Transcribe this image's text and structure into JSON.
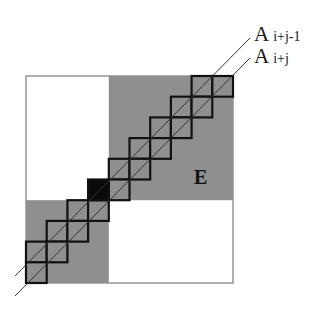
{
  "diagram": {
    "type": "block matrix staircase diagram",
    "grid_size": 10,
    "matrix": {
      "x": 26,
      "y": 76,
      "size": 207
    },
    "colors": {
      "background": "#ffffff",
      "gray_block": "#8f8f8f",
      "cell_border": "#111111",
      "black_cell": "#0a0a0a",
      "outline": "#7a7a7a",
      "diagonal": "#333333"
    },
    "gray_blocks": [
      {
        "name": "upper-right-block",
        "col": 4,
        "row": 0,
        "cols": 6,
        "rows": 6
      },
      {
        "name": "lower-left-block",
        "col": 0,
        "row": 6,
        "cols": 4,
        "rows": 4
      }
    ],
    "black_cell": {
      "col": 3,
      "row": 5
    },
    "staircase_cells": [
      [
        8,
        0
      ],
      [
        9,
        0
      ],
      [
        7,
        1
      ],
      [
        8,
        1
      ],
      [
        6,
        2
      ],
      [
        7,
        2
      ],
      [
        5,
        3
      ],
      [
        6,
        3
      ],
      [
        4,
        4
      ],
      [
        5,
        4
      ],
      [
        4,
        5
      ],
      [
        2,
        6
      ],
      [
        3,
        6
      ],
      [
        1,
        7
      ],
      [
        2,
        7
      ],
      [
        0,
        8
      ],
      [
        1,
        8
      ],
      [
        0,
        9
      ]
    ],
    "diagonals": [
      {
        "name": "A_i+j-1",
        "x1": 15,
        "y1": 276,
        "x2": 250,
        "y2": 38
      },
      {
        "name": "A_i+j",
        "x1": 15,
        "y1": 296,
        "x2": 250,
        "y2": 58
      }
    ]
  },
  "labels": {
    "a_upper": {
      "main": "A",
      "sub": "i+j-1"
    },
    "a_lower": {
      "main": "A",
      "sub": "i+j"
    },
    "block_e": "E"
  }
}
